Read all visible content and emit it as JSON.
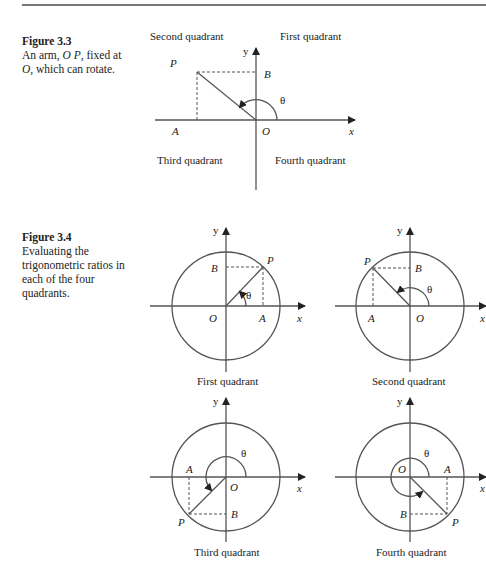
{
  "figure_3_3": {
    "number": "Figure 3.3",
    "caption_line1": "An arm, ",
    "caption_op": "O P",
    "caption_line1b": ", fixed at",
    "caption_o": "O",
    "caption_line2": ", which can rotate.",
    "quadrant_labels": {
      "second": "Second quadrant",
      "first": "First quadrant",
      "third": "Third quadrant",
      "fourth": "Fourth quadrant"
    },
    "points": {
      "P": "P",
      "B": "B",
      "A": "A",
      "O": "O"
    },
    "axes": {
      "x": "x",
      "y": "y"
    },
    "angle": "θ"
  },
  "figure_3_4": {
    "number": "Figure 3.4",
    "caption": "Evaluating the trigonometric ratios in each of the four quadrants.",
    "caption_lines": [
      "Evaluating the",
      "trigonometric ratios in",
      "each of the four",
      "quadrants."
    ],
    "panels": [
      {
        "title": "First quadrant",
        "P": "P",
        "A": "A",
        "B": "B",
        "O": "O",
        "x": "x",
        "y": "y",
        "angle": "θ"
      },
      {
        "title": "Second quadrant",
        "P": "P",
        "A": "A",
        "B": "B",
        "O": "O",
        "x": "x",
        "y": "y",
        "angle": "θ"
      },
      {
        "title": "Third quadrant",
        "P": "P",
        "A": "A",
        "B": "B",
        "O": "O",
        "x": "x",
        "y": "y",
        "angle": "θ"
      },
      {
        "title": "Fourth quadrant",
        "P": "P",
        "A": "A",
        "B": "B",
        "O": "O",
        "x": "x",
        "y": "y",
        "angle": "θ"
      }
    ]
  },
  "colors": {
    "line": "#555555",
    "text": "#222222",
    "rule": "#777777"
  }
}
